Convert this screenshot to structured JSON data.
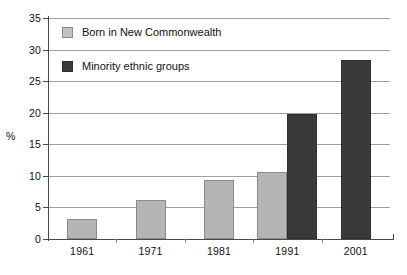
{
  "chart_data": {
    "type": "bar",
    "title": "",
    "xlabel": "",
    "ylabel": "%",
    "categories": [
      "1961",
      "1971",
      "1981",
      "1991",
      "2001"
    ],
    "ylim": [
      0,
      35
    ],
    "yticks": [
      0,
      5,
      10,
      15,
      20,
      25,
      30,
      35
    ],
    "grid": true,
    "legend_position": "upper-left-inside",
    "series": [
      {
        "name": "Born in New Commonwealth",
        "color": "#b5b5b5",
        "values": [
          3.1,
          6.2,
          9.3,
          10.6,
          null
        ]
      },
      {
        "name": "Minority ethnic groups",
        "color": "#3a3a3a",
        "values": [
          null,
          null,
          null,
          19.8,
          28.4
        ]
      }
    ]
  },
  "axis": {
    "y_title": "%",
    "y_tick_labels": [
      "0",
      "5",
      "10",
      "15",
      "20",
      "25",
      "30",
      "35"
    ],
    "x_tick_labels": [
      "1961",
      "1971",
      "1981",
      "1991",
      "2001"
    ]
  },
  "legend": {
    "items": [
      {
        "label": "Born in New Commonwealth",
        "swatch": "light"
      },
      {
        "label": "Minority ethnic groups",
        "swatch": "dark"
      }
    ]
  }
}
